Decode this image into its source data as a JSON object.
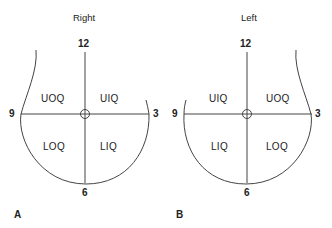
{
  "panels": [
    {
      "id": "A",
      "panel_label": "A",
      "title": "Right",
      "clock": {
        "top": "12",
        "left": "9",
        "right": "3",
        "bottom": "6"
      },
      "quadrants": {
        "upper_left": "UOQ",
        "upper_right": "UIQ",
        "lower_left": "LOQ",
        "lower_right": "LIQ"
      }
    },
    {
      "id": "B",
      "panel_label": "B",
      "title": "Left",
      "clock": {
        "top": "12",
        "left": "9",
        "right": "3",
        "bottom": "6"
      },
      "quadrants": {
        "upper_left": "UIQ",
        "upper_right": "UOQ",
        "lower_left": "LIQ",
        "lower_right": "LOQ"
      }
    }
  ],
  "colors": {
    "line": "#444444",
    "text": "#222222",
    "background": "#ffffff"
  }
}
